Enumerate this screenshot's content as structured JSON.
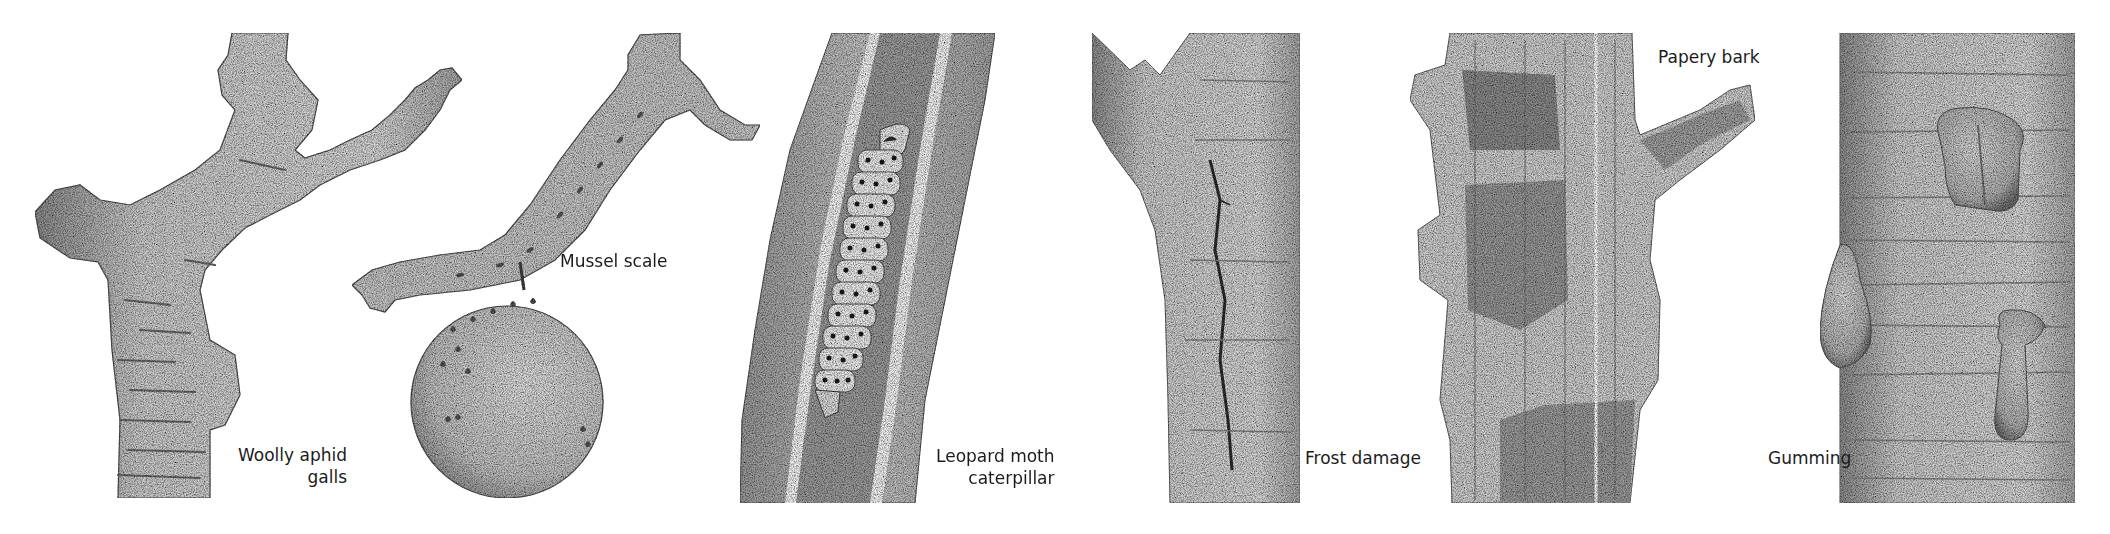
{
  "plate": {
    "background": "#ffffff",
    "ink": "#1c1c1c",
    "bark_fill": "#d6d6d6",
    "bark_shade": "#9a9a9a",
    "panels": [
      {
        "id": "woolly-aphid-galls",
        "label_lines": [
          "Woolly aphid",
          "galls"
        ],
        "subject": "Branched stem with lumpy aphid galls"
      },
      {
        "id": "mussel-scale",
        "label_lines": [
          "Mussel scale"
        ],
        "subject": "Twig and fruit covered with scale insects"
      },
      {
        "id": "leopard-moth-caterpillar",
        "label_lines": [
          "Leopard moth",
          "caterpillar"
        ],
        "subject": "Cut-open branch showing a spotted caterpillar inside its tunnel"
      },
      {
        "id": "frost-damage",
        "label_lines": [
          "Frost damage"
        ],
        "subject": "Trunk with a long vertical frost crack"
      },
      {
        "id": "papery-bark",
        "label_lines": [
          "Papery bark"
        ],
        "subject": "Trunk with peeling sheets of bark"
      },
      {
        "id": "gumming",
        "label_lines": [
          "Gumming"
        ],
        "subject": "Trunk with globules of exuded gum"
      }
    ]
  }
}
